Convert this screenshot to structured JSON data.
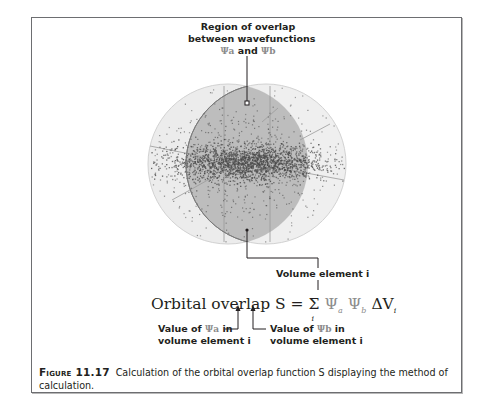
{
  "diagram": {
    "top_label": {
      "line1": "Region of overlap",
      "line2": "between wavefunctions",
      "psi_a": "Ψa",
      "and": "and",
      "psi_b": "Ψb"
    },
    "volume_label": "Volume element i",
    "formula": {
      "lhs": "Orbital overlap S =",
      "sum": "Σ",
      "sum_index": "i",
      "psi": "Ψ",
      "sub_a": "a",
      "sub_b": "b",
      "delta_v": "ΔV",
      "sub_i": "i"
    },
    "left_annotation": {
      "line1_prefix": "Value of",
      "line1_psi": "Ψa",
      "line1_suffix": "in",
      "line2": "volume element i"
    },
    "right_annotation": {
      "line1_prefix": "Value of",
      "line1_psi": "Ψb",
      "line1_suffix": "in",
      "line2": "volume element i"
    },
    "colors": {
      "circle_fill": "#ececec",
      "lens_fill": "#bdbdbd",
      "points": "#4a4a4a",
      "lines": "#231f20"
    }
  },
  "caption": {
    "figure_label": "Figure 11.17",
    "text": "Calculation of the orbital overlap function S displaying the method of calculation."
  }
}
